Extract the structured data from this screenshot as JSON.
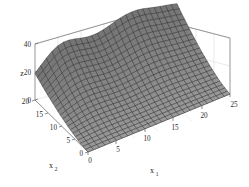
{
  "figure": {
    "kind": "matlab-3d-mesh-surface",
    "background_color": "#ffffff",
    "surface_face_color": "#9a9a9a",
    "surface_line_color": "#2b2b2b",
    "grid_color": "#d8d8d8",
    "axis_line_color": "#8c8c8c",
    "text_color": "#2a2a2a"
  },
  "axes": {
    "x1": {
      "label": "x",
      "subscript": "1",
      "ticks": [
        "0",
        "5",
        "10",
        "15",
        "20",
        "25"
      ],
      "min": 0,
      "max": 25
    },
    "x2": {
      "label": "x",
      "subscript": "2",
      "ticks": [
        "0",
        "5",
        "10",
        "15",
        "20"
      ],
      "min": 0,
      "max": 20
    },
    "z": {
      "label": "z",
      "ticks": [
        "0",
        "20",
        "40"
      ],
      "min": 0,
      "max": 40
    }
  },
  "chart_data": {
    "type": "surface",
    "title": "",
    "xlabel": "x1",
    "ylabel": "x2",
    "zlabel": "z",
    "xlim": [
      0,
      25
    ],
    "ylim": [
      0,
      20
    ],
    "zlim": [
      0,
      40
    ],
    "grid": true,
    "legend": "none",
    "x": [
      0,
      1.25,
      2.5,
      3.75,
      5,
      6.25,
      7.5,
      8.75,
      10,
      11.25,
      12.5,
      13.75,
      15,
      16.25,
      17.5,
      18.75,
      20,
      21.25,
      22.5,
      23.75,
      25
    ],
    "y": [
      0,
      1,
      2,
      3,
      4,
      5,
      6,
      7,
      8,
      9,
      10,
      11,
      12,
      13,
      14,
      15,
      16,
      17,
      18,
      19,
      20
    ],
    "z_profile_at_x2_max": [
      30,
      33,
      36,
      38,
      37,
      34,
      30,
      26,
      23,
      22,
      24,
      28,
      32,
      35,
      36,
      36,
      35,
      34,
      33,
      32,
      31
    ],
    "z_profile_at_x2_mid": [
      8,
      10,
      12,
      14,
      15,
      15,
      14,
      13,
      12,
      12,
      13,
      15,
      17,
      19,
      20,
      20,
      20,
      19,
      19,
      18,
      18
    ],
    "z_profile_at_x2_min": [
      0,
      0,
      0,
      0,
      0,
      0,
      0,
      0,
      0,
      0,
      0,
      0,
      0,
      0,
      0,
      0,
      0,
      0,
      0,
      0,
      0
    ]
  }
}
